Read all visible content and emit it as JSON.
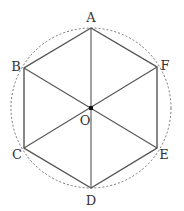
{
  "diagram": {
    "type": "regular-hexagon-inscribed-in-circle",
    "center": {
      "label": "O",
      "x": 91,
      "y": 108
    },
    "circle": {
      "r": 80,
      "style": "dashed"
    },
    "vertices": [
      {
        "label": "A",
        "x": 91,
        "y": 28,
        "lx": 91,
        "ly": 22
      },
      {
        "label": "B",
        "x": 24,
        "y": 68,
        "lx": 16,
        "ly": 71
      },
      {
        "label": "C",
        "x": 24,
        "y": 148,
        "lx": 17,
        "ly": 159
      },
      {
        "label": "D",
        "x": 91,
        "y": 188,
        "lx": 91,
        "ly": 205
      },
      {
        "label": "E",
        "x": 157,
        "y": 148,
        "lx": 164,
        "ly": 159
      },
      {
        "label": "F",
        "x": 157,
        "y": 67,
        "lx": 165,
        "ly": 70
      }
    ],
    "center_label": {
      "text": "O",
      "lx": 85,
      "ly": 125
    },
    "edges": [
      "AB",
      "BC",
      "CD",
      "DE",
      "EF",
      "FA"
    ],
    "diagonals": [
      "AD",
      "BE",
      "CF"
    ]
  }
}
